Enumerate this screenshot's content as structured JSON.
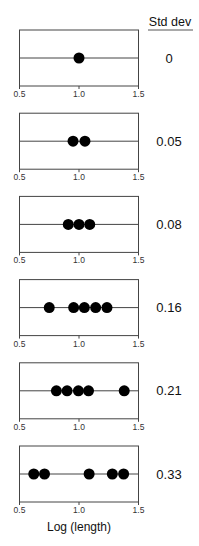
{
  "chart_data": {
    "type": "scatter",
    "title": "",
    "xlabel": "Log (length)",
    "ylabel": "",
    "xlim": [
      0.5,
      1.5
    ],
    "x_ticks": [
      "0.5",
      "1.0",
      "1.5"
    ],
    "right_header": "Std dev",
    "grid": false,
    "panels": [
      {
        "std_dev": "0",
        "x": [
          1.0
        ]
      },
      {
        "std_dev": "0.05",
        "x": [
          0.95,
          1.05
        ]
      },
      {
        "std_dev": "0.08",
        "x": [
          0.91,
          1.0,
          1.09
        ]
      },
      {
        "std_dev": "0.16",
        "x": [
          0.75,
          0.955,
          1.045,
          1.14,
          1.235
        ]
      },
      {
        "std_dev": "0.21",
        "x": [
          0.81,
          0.9,
          0.995,
          1.08,
          1.38
        ]
      },
      {
        "std_dev": "0.33",
        "x": [
          0.62,
          0.71,
          1.085,
          1.28,
          1.375
        ]
      }
    ]
  }
}
